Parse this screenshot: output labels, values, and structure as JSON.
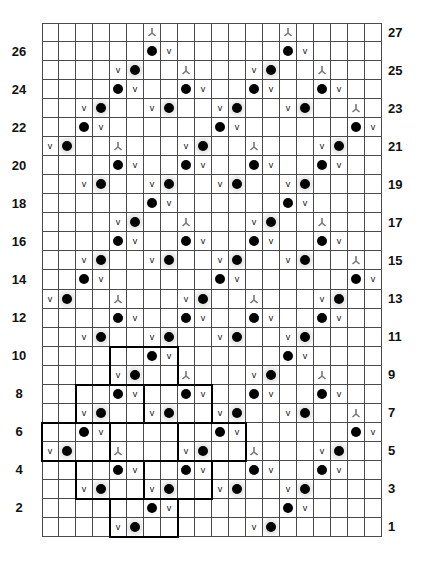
{
  "chart_data": {
    "type": "table",
    "title": "",
    "columns": 20,
    "rows": 27,
    "row_labels_left": [
      "26",
      "24",
      "22",
      "20",
      "18",
      "16",
      "14",
      "12",
      "10",
      "8",
      "6",
      "4",
      "2"
    ],
    "row_labels_right": [
      "27",
      "25",
      "23",
      "21",
      "19",
      "17",
      "15",
      "13",
      "11",
      "9",
      "7",
      "5",
      "3",
      "1"
    ],
    "legend_symbols": {
      "dot": "black dot",
      "dot_shaded": "black dot on shaded cell",
      "v": "v",
      "y": "inverted Y (gray)"
    },
    "row_cells": {
      "27": [
        {
          "c": 7,
          "s": "y"
        },
        {
          "c": 15,
          "s": "y"
        }
      ],
      "26": [
        {
          "c": 7,
          "s": "dot"
        },
        {
          "c": 8,
          "s": "v"
        },
        {
          "c": 15,
          "s": "dot"
        },
        {
          "c": 16,
          "s": "v"
        }
      ],
      "25": [
        {
          "c": 5,
          "s": "v"
        },
        {
          "c": 6,
          "s": "dot_shaded"
        },
        {
          "c": 9,
          "s": "y"
        },
        {
          "c": 13,
          "s": "v"
        },
        {
          "c": 14,
          "s": "dot_shaded"
        },
        {
          "c": 17,
          "s": "y"
        }
      ],
      "24": [
        {
          "c": 5,
          "s": "dot"
        },
        {
          "c": 6,
          "s": "v"
        },
        {
          "c": 9,
          "s": "dot"
        },
        {
          "c": 10,
          "s": "v"
        },
        {
          "c": 13,
          "s": "dot"
        },
        {
          "c": 14,
          "s": "v"
        },
        {
          "c": 17,
          "s": "dot"
        },
        {
          "c": 18,
          "s": "v"
        }
      ],
      "23": [
        {
          "c": 3,
          "s": "v"
        },
        {
          "c": 4,
          "s": "dot_shaded"
        },
        {
          "c": 7,
          "s": "v"
        },
        {
          "c": 8,
          "s": "dot_shaded"
        },
        {
          "c": 11,
          "s": "v"
        },
        {
          "c": 12,
          "s": "dot_shaded"
        },
        {
          "c": 15,
          "s": "v"
        },
        {
          "c": 16,
          "s": "dot_shaded"
        },
        {
          "c": 19,
          "s": "y"
        }
      ],
      "22": [
        {
          "c": 3,
          "s": "dot"
        },
        {
          "c": 4,
          "s": "v"
        },
        {
          "c": 11,
          "s": "dot"
        },
        {
          "c": 12,
          "s": "v"
        },
        {
          "c": 19,
          "s": "dot"
        },
        {
          "c": 20,
          "s": "v"
        }
      ],
      "21": [
        {
          "c": 1,
          "s": "v"
        },
        {
          "c": 2,
          "s": "dot_shaded"
        },
        {
          "c": 5,
          "s": "y"
        },
        {
          "c": 9,
          "s": "v"
        },
        {
          "c": 10,
          "s": "dot_shaded"
        },
        {
          "c": 13,
          "s": "y"
        },
        {
          "c": 17,
          "s": "v"
        },
        {
          "c": 18,
          "s": "dot_shaded"
        }
      ],
      "20": [
        {
          "c": 5,
          "s": "dot"
        },
        {
          "c": 6,
          "s": "v"
        },
        {
          "c": 9,
          "s": "dot"
        },
        {
          "c": 10,
          "s": "v"
        },
        {
          "c": 13,
          "s": "dot"
        },
        {
          "c": 14,
          "s": "v"
        },
        {
          "c": 17,
          "s": "dot"
        },
        {
          "c": 18,
          "s": "v"
        }
      ],
      "19": [
        {
          "c": 3,
          "s": "v"
        },
        {
          "c": 4,
          "s": "dot_shaded"
        },
        {
          "c": 7,
          "s": "v"
        },
        {
          "c": 8,
          "s": "dot_shaded"
        },
        {
          "c": 11,
          "s": "v"
        },
        {
          "c": 12,
          "s": "dot_shaded"
        },
        {
          "c": 15,
          "s": "v"
        },
        {
          "c": 16,
          "s": "dot_shaded"
        }
      ],
      "18": [
        {
          "c": 7,
          "s": "dot"
        },
        {
          "c": 8,
          "s": "v"
        },
        {
          "c": 15,
          "s": "dot"
        },
        {
          "c": 16,
          "s": "v"
        }
      ],
      "17": [
        {
          "c": 5,
          "s": "v"
        },
        {
          "c": 6,
          "s": "dot_shaded"
        },
        {
          "c": 9,
          "s": "y"
        },
        {
          "c": 13,
          "s": "v"
        },
        {
          "c": 14,
          "s": "dot_shaded"
        },
        {
          "c": 17,
          "s": "y"
        }
      ],
      "16": [
        {
          "c": 5,
          "s": "dot"
        },
        {
          "c": 6,
          "s": "v"
        },
        {
          "c": 9,
          "s": "dot"
        },
        {
          "c": 10,
          "s": "v"
        },
        {
          "c": 13,
          "s": "dot"
        },
        {
          "c": 14,
          "s": "v"
        },
        {
          "c": 17,
          "s": "dot"
        },
        {
          "c": 18,
          "s": "v"
        }
      ],
      "15": [
        {
          "c": 3,
          "s": "v"
        },
        {
          "c": 4,
          "s": "dot_shaded"
        },
        {
          "c": 7,
          "s": "v"
        },
        {
          "c": 8,
          "s": "dot_shaded"
        },
        {
          "c": 11,
          "s": "v"
        },
        {
          "c": 12,
          "s": "dot_shaded"
        },
        {
          "c": 15,
          "s": "v"
        },
        {
          "c": 16,
          "s": "dot_shaded"
        },
        {
          "c": 19,
          "s": "y"
        }
      ],
      "14": [
        {
          "c": 3,
          "s": "dot"
        },
        {
          "c": 4,
          "s": "v"
        },
        {
          "c": 11,
          "s": "dot"
        },
        {
          "c": 12,
          "s": "v"
        },
        {
          "c": 19,
          "s": "dot"
        },
        {
          "c": 20,
          "s": "v"
        }
      ],
      "13": [
        {
          "c": 1,
          "s": "v"
        },
        {
          "c": 2,
          "s": "dot_shaded"
        },
        {
          "c": 5,
          "s": "y"
        },
        {
          "c": 9,
          "s": "v"
        },
        {
          "c": 10,
          "s": "dot_shaded"
        },
        {
          "c": 13,
          "s": "y"
        },
        {
          "c": 17,
          "s": "v"
        },
        {
          "c": 18,
          "s": "dot_shaded"
        }
      ],
      "12": [
        {
          "c": 5,
          "s": "dot"
        },
        {
          "c": 6,
          "s": "v"
        },
        {
          "c": 9,
          "s": "dot"
        },
        {
          "c": 10,
          "s": "v"
        },
        {
          "c": 13,
          "s": "dot"
        },
        {
          "c": 14,
          "s": "v"
        },
        {
          "c": 17,
          "s": "dot"
        },
        {
          "c": 18,
          "s": "v"
        }
      ],
      "11": [
        {
          "c": 3,
          "s": "v"
        },
        {
          "c": 4,
          "s": "dot_shaded"
        },
        {
          "c": 7,
          "s": "v"
        },
        {
          "c": 8,
          "s": "dot_shaded"
        },
        {
          "c": 11,
          "s": "v"
        },
        {
          "c": 12,
          "s": "dot_shaded"
        },
        {
          "c": 15,
          "s": "v"
        },
        {
          "c": 16,
          "s": "dot_shaded"
        }
      ],
      "10": [
        {
          "c": 7,
          "s": "dot"
        },
        {
          "c": 8,
          "s": "v"
        },
        {
          "c": 15,
          "s": "dot"
        },
        {
          "c": 16,
          "s": "v"
        }
      ],
      "9": [
        {
          "c": 5,
          "s": "v"
        },
        {
          "c": 6,
          "s": "dot_shaded"
        },
        {
          "c": 9,
          "s": "y"
        },
        {
          "c": 13,
          "s": "v"
        },
        {
          "c": 14,
          "s": "dot_shaded"
        },
        {
          "c": 17,
          "s": "y"
        }
      ],
      "8": [
        {
          "c": 5,
          "s": "dot"
        },
        {
          "c": 6,
          "s": "v"
        },
        {
          "c": 9,
          "s": "dot"
        },
        {
          "c": 10,
          "s": "v"
        },
        {
          "c": 13,
          "s": "dot"
        },
        {
          "c": 14,
          "s": "v"
        },
        {
          "c": 17,
          "s": "dot"
        },
        {
          "c": 18,
          "s": "v"
        }
      ],
      "7": [
        {
          "c": 3,
          "s": "v"
        },
        {
          "c": 4,
          "s": "dot_shaded"
        },
        {
          "c": 7,
          "s": "v"
        },
        {
          "c": 8,
          "s": "dot_shaded"
        },
        {
          "c": 11,
          "s": "v"
        },
        {
          "c": 12,
          "s": "dot_shaded"
        },
        {
          "c": 15,
          "s": "v"
        },
        {
          "c": 16,
          "s": "dot_shaded"
        },
        {
          "c": 19,
          "s": "y"
        }
      ],
      "6": [
        {
          "c": 3,
          "s": "dot"
        },
        {
          "c": 4,
          "s": "v"
        },
        {
          "c": 11,
          "s": "dot"
        },
        {
          "c": 12,
          "s": "v"
        },
        {
          "c": 19,
          "s": "dot"
        },
        {
          "c": 20,
          "s": "v"
        }
      ],
      "5": [
        {
          "c": 1,
          "s": "v"
        },
        {
          "c": 2,
          "s": "dot_shaded"
        },
        {
          "c": 5,
          "s": "y"
        },
        {
          "c": 9,
          "s": "v"
        },
        {
          "c": 10,
          "s": "dot_shaded"
        },
        {
          "c": 13,
          "s": "y"
        },
        {
          "c": 17,
          "s": "v"
        },
        {
          "c": 18,
          "s": "dot_shaded"
        }
      ],
      "4": [
        {
          "c": 5,
          "s": "dot"
        },
        {
          "c": 6,
          "s": "v"
        },
        {
          "c": 9,
          "s": "dot"
        },
        {
          "c": 10,
          "s": "v"
        },
        {
          "c": 13,
          "s": "dot"
        },
        {
          "c": 14,
          "s": "v"
        },
        {
          "c": 17,
          "s": "dot"
        },
        {
          "c": 18,
          "s": "v"
        }
      ],
      "3": [
        {
          "c": 3,
          "s": "v"
        },
        {
          "c": 4,
          "s": "dot_shaded"
        },
        {
          "c": 7,
          "s": "v"
        },
        {
          "c": 8,
          "s": "dot_shaded"
        },
        {
          "c": 11,
          "s": "v"
        },
        {
          "c": 12,
          "s": "dot_shaded"
        },
        {
          "c": 15,
          "s": "v"
        },
        {
          "c": 16,
          "s": "dot_shaded"
        }
      ],
      "2": [
        {
          "c": 7,
          "s": "dot"
        },
        {
          "c": 8,
          "s": "v"
        },
        {
          "c": 15,
          "s": "dot"
        },
        {
          "c": 16,
          "s": "v"
        }
      ],
      "1": [
        {
          "c": 5,
          "s": "v"
        },
        {
          "c": 6,
          "s": "dot_shaded"
        },
        {
          "c": 13,
          "s": "v"
        },
        {
          "c": 14,
          "s": "dot_shaded"
        }
      ]
    },
    "repeat_outlines": [
      {
        "rows": [
          9,
          10
        ],
        "cols": [
          5,
          8
        ]
      },
      {
        "rows": [
          7,
          8
        ],
        "cols": [
          3,
          6
        ]
      },
      {
        "rows": [
          7,
          8
        ],
        "cols": [
          7,
          10
        ]
      },
      {
        "rows": [
          5,
          6
        ],
        "cols": [
          1,
          4
        ]
      },
      {
        "rows": [
          5,
          6
        ],
        "cols": [
          5,
          8
        ]
      },
      {
        "rows": [
          5,
          6
        ],
        "cols": [
          9,
          12
        ]
      },
      {
        "rows": [
          3,
          4
        ],
        "cols": [
          3,
          6
        ]
      },
      {
        "rows": [
          3,
          4
        ],
        "cols": [
          7,
          10
        ]
      },
      {
        "rows": [
          1,
          2
        ],
        "cols": [
          5,
          8
        ]
      }
    ],
    "symbol_text": {
      "v": "v"
    },
    "colors": {
      "grid": "#4a4a4a",
      "dot": "#000000",
      "shade": "#e3e3e3",
      "y_symbol": "#777777",
      "outline": "#000000"
    }
  }
}
